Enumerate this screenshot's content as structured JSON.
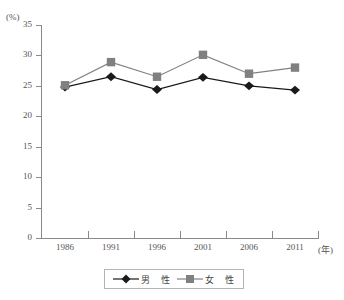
{
  "chart_data": {
    "type": "line",
    "title": "",
    "subtitle": "",
    "xlabel": "(年)",
    "ylabel": "(%)",
    "categories": [
      "1986",
      "1991",
      "1996",
      "2001",
      "2006",
      "2011"
    ],
    "ylim": [
      0,
      35
    ],
    "ytick_values": [
      "35",
      "30",
      "25",
      "20",
      "15",
      "10",
      "5",
      "0"
    ],
    "grid": false,
    "legend_position": "bottom-center",
    "series": [
      {
        "name": "男　性",
        "marker": "diamond",
        "color": "#1a1a1a",
        "values": [
          24.8,
          26.5,
          24.4,
          26.4,
          25.0,
          24.3
        ]
      },
      {
        "name": "女　性",
        "marker": "square",
        "color": "#808080",
        "values": [
          25.1,
          28.9,
          26.5,
          30.1,
          27.0,
          28.0
        ]
      }
    ]
  },
  "axes": {
    "y_unit_label": "(%)",
    "x_unit_label": "(年)"
  },
  "legend": {
    "items": [
      {
        "label": "男　性",
        "marker": "diamond-marker",
        "color": "#1a1a1a"
      },
      {
        "label": "女　性",
        "marker": "square-marker",
        "color": "#808080"
      }
    ]
  }
}
